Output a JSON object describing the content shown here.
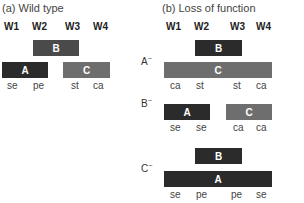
{
  "panel_a": {
    "title": "(a)  Wild type",
    "whorls": [
      "W1",
      "W2",
      "W3",
      "W4"
    ],
    "genes": {
      "B": "B",
      "A": "A",
      "C": "C"
    },
    "organs": [
      "se",
      "pe",
      "st",
      "ca"
    ]
  },
  "panel_b": {
    "title": "(b)  Loss of function",
    "whorls": [
      "W1",
      "W2",
      "W3",
      "W4"
    ],
    "rows": [
      {
        "label": "A",
        "sup": "−",
        "genes": {
          "B": "B",
          "C": "C"
        },
        "organs": [
          "ca",
          "st",
          "st",
          "ca"
        ]
      },
      {
        "label": "B",
        "sup": "−",
        "genes": {
          "A": "A",
          "C": "C"
        },
        "organs": [
          "se",
          "se",
          "ca",
          "ca"
        ]
      },
      {
        "label": "C",
        "sup": "−",
        "genes": {
          "B": "B",
          "A": "A"
        },
        "organs": [
          "se",
          "pe",
          "pe",
          "se"
        ]
      }
    ]
  }
}
